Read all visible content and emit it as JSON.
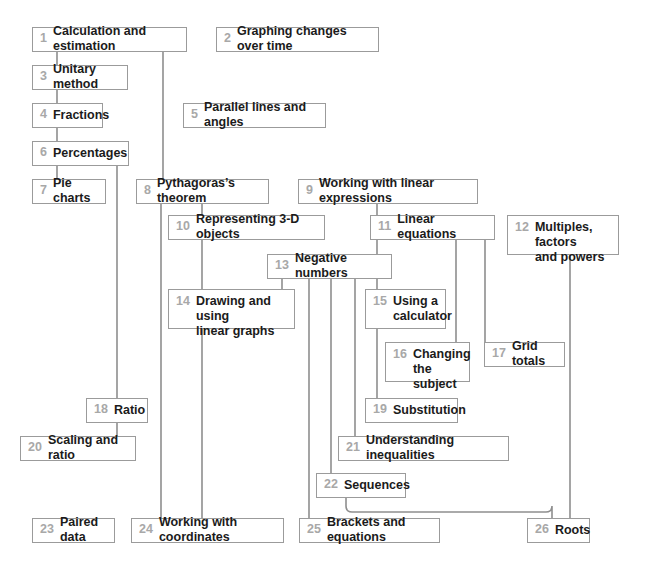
{
  "diagram": {
    "type": "flowchart",
    "background_color": "#ffffff",
    "box_border_color": "#9b9b9b",
    "number_color": "#a8a8a8",
    "label_color": "#1b1b1b",
    "connector_color": "#8e8e8e",
    "nodes": [
      {
        "id": 1,
        "num": "1",
        "label": "Calculation and estimation",
        "x": 32,
        "y": 27,
        "w": 155,
        "h": 25
      },
      {
        "id": 2,
        "num": "2",
        "label": "Graphing changes over time",
        "x": 216,
        "y": 27,
        "w": 163,
        "h": 25
      },
      {
        "id": 3,
        "num": "3",
        "label": "Unitary method",
        "x": 32,
        "y": 65,
        "w": 96,
        "h": 25
      },
      {
        "id": 4,
        "num": "4",
        "label": "Fractions",
        "x": 32,
        "y": 103,
        "w": 71,
        "h": 25
      },
      {
        "id": 5,
        "num": "5",
        "label": "Parallel lines and angles",
        "x": 183,
        "y": 103,
        "w": 143,
        "h": 25
      },
      {
        "id": 6,
        "num": "6",
        "label": "Percentages",
        "x": 32,
        "y": 141,
        "w": 97,
        "h": 25
      },
      {
        "id": 7,
        "num": "7",
        "label": "Pie charts",
        "x": 32,
        "y": 179,
        "w": 74,
        "h": 25
      },
      {
        "id": 8,
        "num": "8",
        "label": "Pythagoras’s theorem",
        "x": 136,
        "y": 179,
        "w": 133,
        "h": 25
      },
      {
        "id": 9,
        "num": "9",
        "label": "Working with linear expressions",
        "x": 298,
        "y": 179,
        "w": 180,
        "h": 25
      },
      {
        "id": 10,
        "num": "10",
        "label": "Representing 3-D objects",
        "x": 168,
        "y": 215,
        "w": 157,
        "h": 25
      },
      {
        "id": 11,
        "num": "11",
        "label": "Linear equations",
        "x": 370,
        "y": 215,
        "w": 125,
        "h": 25
      },
      {
        "id": 12,
        "num": "12",
        "label": "Multiples, factors\nand powers",
        "x": 507,
        "y": 215,
        "w": 112,
        "h": 40
      },
      {
        "id": 13,
        "num": "13",
        "label": "Negative numbers",
        "x": 267,
        "y": 254,
        "w": 125,
        "h": 25
      },
      {
        "id": 14,
        "num": "14",
        "label": "Drawing and using\nlinear graphs",
        "x": 168,
        "y": 289,
        "w": 127,
        "h": 40
      },
      {
        "id": 15,
        "num": "15",
        "label": "Using a\ncalculator",
        "x": 365,
        "y": 289,
        "w": 81,
        "h": 40
      },
      {
        "id": 16,
        "num": "16",
        "label": "Changing\nthe subject",
        "x": 385,
        "y": 342,
        "w": 85,
        "h": 40
      },
      {
        "id": 17,
        "num": "17",
        "label": "Grid totals",
        "x": 484,
        "y": 342,
        "w": 81,
        "h": 25
      },
      {
        "id": 18,
        "num": "18",
        "label": "Ratio",
        "x": 86,
        "y": 398,
        "w": 62,
        "h": 25
      },
      {
        "id": 19,
        "num": "19",
        "label": "Substitution",
        "x": 365,
        "y": 398,
        "w": 93,
        "h": 25
      },
      {
        "id": 20,
        "num": "20",
        "label": "Scaling and ratio",
        "x": 20,
        "y": 436,
        "w": 116,
        "h": 25
      },
      {
        "id": 21,
        "num": "21",
        "label": "Understanding inequalities",
        "x": 338,
        "y": 436,
        "w": 171,
        "h": 25
      },
      {
        "id": 22,
        "num": "22",
        "label": "Sequences",
        "x": 316,
        "y": 473,
        "w": 90,
        "h": 25
      },
      {
        "id": 23,
        "num": "23",
        "label": "Paired data",
        "x": 32,
        "y": 518,
        "w": 83,
        "h": 25
      },
      {
        "id": 24,
        "num": "24",
        "label": "Working with coordinates",
        "x": 131,
        "y": 518,
        "w": 153,
        "h": 25
      },
      {
        "id": 25,
        "num": "25",
        "label": "Brackets and equations",
        "x": 299,
        "y": 518,
        "w": 141,
        "h": 25
      },
      {
        "id": 26,
        "num": "26",
        "label": "Roots",
        "x": 527,
        "y": 518,
        "w": 63,
        "h": 25
      }
    ],
    "connections": [
      {
        "from": 1,
        "to": 3,
        "path": "M57,52 L57,65"
      },
      {
        "from": 3,
        "to": 4,
        "path": "M57,90 L57,103"
      },
      {
        "from": 4,
        "to": 6,
        "path": "M57,128 L57,141"
      },
      {
        "from": 6,
        "to": 7,
        "path": "M57,166 L57,179"
      },
      {
        "from": 6,
        "to": 18,
        "path": "M117,166 L117,398"
      },
      {
        "from": 18,
        "to": 20,
        "path": "M117,423 L117,436"
      },
      {
        "from": 1,
        "to": 8,
        "path": "M163,52 L163,179"
      },
      {
        "from": 8,
        "to": 10,
        "path": "M202,204 L202,215"
      },
      {
        "from": 8,
        "to": 23,
        "path": "M161,204 L161,518"
      },
      {
        "from": 10,
        "to": 14,
        "path": "M202,240 L202,289"
      },
      {
        "from": 14,
        "to": 24,
        "path": "M202,329 L202,518"
      },
      {
        "from": 9,
        "to": 11,
        "path": "M377,204 L377,215"
      },
      {
        "from": 11,
        "to": 13,
        "path": "M377,240 L377,254"
      },
      {
        "from": 13,
        "to": 15,
        "path": "M377,279 L377,289"
      },
      {
        "from": 15,
        "to": 19,
        "path": "M377,329 L377,398"
      },
      {
        "from": 11,
        "to": 16,
        "path": "M456,240 L456,342"
      },
      {
        "from": 11,
        "to": 17,
        "path": "M485,240 L485,342"
      },
      {
        "from": 13,
        "to": 14,
        "path": "M282,279 L282,289"
      },
      {
        "from": 13,
        "to": 25,
        "path": "M309,279 L309,518"
      },
      {
        "from": 13,
        "to": 22,
        "path": "M331,279 L331,473"
      },
      {
        "from": 13,
        "to": 21,
        "path": "M355,279 L355,436"
      },
      {
        "from": 12,
        "to": 26,
        "path": "M570,255 L570,518"
      },
      {
        "from": 22,
        "to": 26,
        "path": "M346,498 L346,506 Q346,512 352,512 L546,512 Q552,512 552,506 L552,518"
      }
    ]
  }
}
